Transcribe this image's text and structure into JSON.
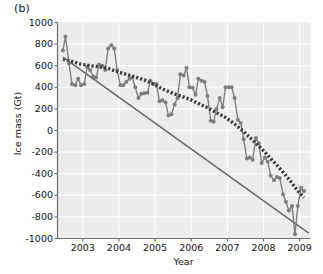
{
  "panel": {
    "label": "(b)"
  },
  "chart_data": {
    "type": "line",
    "title": "",
    "subtitle": "",
    "xlabel": "Year",
    "ylabel": "Ice mass (Gt)",
    "xlim": [
      2002.3,
      2009.3
    ],
    "ylim": [
      -1000,
      1000
    ],
    "grid": true,
    "legend": "none",
    "xticks": [
      2003,
      2004,
      2005,
      2006,
      2007,
      2008,
      2009
    ],
    "xticklabels": [
      "2003",
      "2004",
      "2005",
      "2006",
      "2007",
      "2008",
      "2009"
    ],
    "yticks": [
      1000,
      800,
      600,
      400,
      200,
      0,
      -200,
      -400,
      -600,
      -800,
      -1000
    ],
    "yticklabels": [
      "1000",
      "800",
      "600",
      "400",
      "200",
      "0",
      "-200",
      "-400",
      "-600",
      "-800",
      "-1000"
    ],
    "colors": {
      "observations": "#7d7d7d",
      "smoothed": "#4a4a4a",
      "trend": "#6a6a6a",
      "plot_background": "#ececec",
      "gridline": "#ffffff",
      "axis": "#6e6e6e",
      "text": "#111111"
    },
    "series": [
      {
        "name": "Ice mass anomaly (monthly observations)",
        "style": "line-with-circle-markers",
        "color": "#7d7d7d",
        "x": [
          2002.45,
          2002.52,
          2002.62,
          2002.7,
          2002.79,
          2002.87,
          2002.95,
          2003.04,
          2003.12,
          2003.2,
          2003.29,
          2003.37,
          2003.45,
          2003.54,
          2003.62,
          2003.7,
          2003.79,
          2003.87,
          2003.95,
          2004.04,
          2004.12,
          2004.2,
          2004.29,
          2004.37,
          2004.45,
          2004.54,
          2004.62,
          2004.7,
          2004.79,
          2004.87,
          2004.95,
          2005.04,
          2005.12,
          2005.2,
          2005.29,
          2005.37,
          2005.45,
          2005.54,
          2005.62,
          2005.7,
          2005.79,
          2005.87,
          2005.95,
          2006.04,
          2006.12,
          2006.2,
          2006.29,
          2006.37,
          2006.45,
          2006.54,
          2006.62,
          2006.7,
          2006.79,
          2006.87,
          2006.95,
          2007.04,
          2007.12,
          2007.2,
          2007.29,
          2007.37,
          2007.45,
          2007.54,
          2007.62,
          2007.7,
          2007.79,
          2007.87,
          2007.95,
          2008.04,
          2008.12,
          2008.2,
          2008.29,
          2008.37,
          2008.45,
          2008.54,
          2008.62,
          2008.7,
          2008.79,
          2008.87,
          2008.95,
          2009.04,
          2009.12
        ],
        "y": [
          740,
          870,
          620,
          430,
          420,
          480,
          420,
          430,
          590,
          560,
          500,
          490,
          610,
          600,
          560,
          760,
          790,
          760,
          560,
          420,
          420,
          450,
          480,
          490,
          400,
          300,
          340,
          345,
          350,
          460,
          430,
          430,
          270,
          280,
          260,
          140,
          150,
          240,
          300,
          520,
          510,
          580,
          400,
          395,
          330,
          480,
          460,
          450,
          320,
          90,
          80,
          200,
          300,
          215,
          400,
          400,
          400,
          300,
          100,
          70,
          -80,
          -260,
          -250,
          -270,
          -70,
          -120,
          -300,
          -250,
          -290,
          -420,
          -460,
          -430,
          -440,
          -590,
          -660,
          -740,
          -700,
          -960,
          -700,
          -530,
          -560
        ],
        "units": "Gt"
      },
      {
        "name": "Smoothed / filtered ice mass",
        "style": "dashed-thick-dark",
        "color": "#3b3b3b",
        "x": [
          2002.45,
          2002.7,
          2002.95,
          2003.2,
          2003.45,
          2003.7,
          2003.95,
          2004.2,
          2004.45,
          2004.7,
          2004.95,
          2005.2,
          2005.45,
          2005.7,
          2005.95,
          2006.2,
          2006.45,
          2006.7,
          2006.95,
          2007.2,
          2007.45,
          2007.7,
          2007.95,
          2008.2,
          2008.45,
          2008.7,
          2008.95,
          2009.12
        ],
        "y": [
          660,
          640,
          615,
          600,
          590,
          575,
          545,
          520,
          495,
          470,
          430,
          385,
          350,
          320,
          290,
          250,
          210,
          165,
          120,
          60,
          -10,
          -90,
          -170,
          -260,
          -350,
          -450,
          -560,
          -620
        ],
        "units": "Gt"
      },
      {
        "name": "Linear trend",
        "style": "solid-straight",
        "color": "#6a6a6a",
        "x": [
          2002.45,
          2009.25
        ],
        "y": [
          680,
          -950
        ],
        "units": "Gt",
        "slope_per_year": -240
      }
    ]
  }
}
